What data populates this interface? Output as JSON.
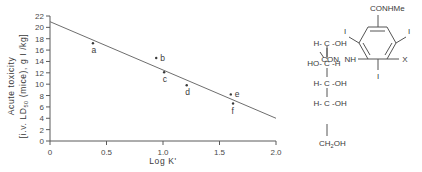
{
  "figure": {
    "chart_data": {
      "type": "scatter",
      "title": "",
      "xlabel": "Log K'",
      "ylabel_line1": "Acute toxicity",
      "ylabel_line2_pre": "[i.v. LD",
      "ylabel_line2_sub": "50",
      "ylabel_line2_post": " (mice), g I /kg]",
      "xlim": [
        0,
        2.0
      ],
      "ylim": [
        0,
        22
      ],
      "xticks": [
        0,
        0.5,
        1.0,
        1.5,
        2.0
      ],
      "xtick_labels": [
        "0",
        "0.5",
        "1.0",
        "1.5",
        "2.0"
      ],
      "yticks": [
        0,
        2,
        4,
        6,
        8,
        10,
        12,
        14,
        16,
        18,
        20,
        22
      ],
      "ytick_labels": [
        "0",
        "2",
        "4",
        "6",
        "8",
        "10",
        "12",
        "14",
        "16",
        "18",
        "20",
        "22"
      ],
      "grid": false,
      "legend": "none",
      "points": [
        {
          "label": "a",
          "x": 0.38,
          "y": 17.2
        },
        {
          "label": "b",
          "x": 0.94,
          "y": 14.6
        },
        {
          "label": "c",
          "x": 1.01,
          "y": 12.1
        },
        {
          "label": "d",
          "x": 1.21,
          "y": 9.8
        },
        {
          "label": "e",
          "x": 1.6,
          "y": 8.2
        },
        {
          "label": "f",
          "x": 1.62,
          "y": 6.6
        }
      ],
      "fit_line": {
        "x_start": 0.0,
        "y_start": 21.0,
        "x_end": 2.0,
        "y_end": 4.0
      },
      "point_marker_color": "#3a3a3a",
      "line_color": "#6e6e6e",
      "axis_color": "#5a5a5a"
    },
    "structure": {
      "name": "iodinated-contrast-agent-structure",
      "ring_substituents": {
        "top_right_amide": "CONHMe",
        "iodine_left": "I",
        "iodine_right": "I",
        "iodine_bottom": "I",
        "variable_group": "X",
        "ring_nh": "NH",
        "side_carbonyl": "CON"
      },
      "chain": [
        {
          "left": "H-",
          "center": "C",
          "right": "-OH"
        },
        {
          "left": "HO-",
          "center": "C",
          "right": "-H"
        },
        {
          "left": "H-",
          "center": "C",
          "right": "-OH"
        },
        {
          "left": "H-",
          "center": "C",
          "right": "-OH"
        }
      ],
      "terminal_pre": "CH",
      "terminal_sub": "2",
      "terminal_post": "OH"
    }
  }
}
